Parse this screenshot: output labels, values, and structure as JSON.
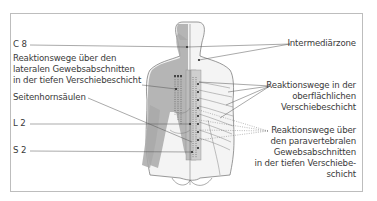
{
  "figure": {
    "title": "",
    "labels_left": {
      "c8": "C 8",
      "lateral_1": "Reaktionswege über den",
      "lateral_2": "lateralen Gewebsabschnitten",
      "lateral_3": "in der tiefen Verschiebeschicht",
      "seitenhorn": "Seitenhornsäulen",
      "l2": "L 2",
      "s2": "S 2"
    },
    "labels_right": {
      "intermediaer": "Intermediärzone",
      "oberfl_1": "Reaktionswege in der",
      "oberfl_2": "oberflächlichen",
      "oberfl_3": "Verschiebeschicht",
      "para_1": "Reaktionswege über",
      "para_2": "den paravertebralen",
      "para_3": "Gewebsabschnitten",
      "para_4": "in der tiefen Verschiebe-",
      "para_5": "schicht"
    },
    "colors": {
      "frame": "#bdbdbd",
      "body_fill": "#f4f4f4",
      "shaded_left": "#a9a9a9",
      "outline": "#6e6e6e",
      "leader": "#555555"
    }
  }
}
